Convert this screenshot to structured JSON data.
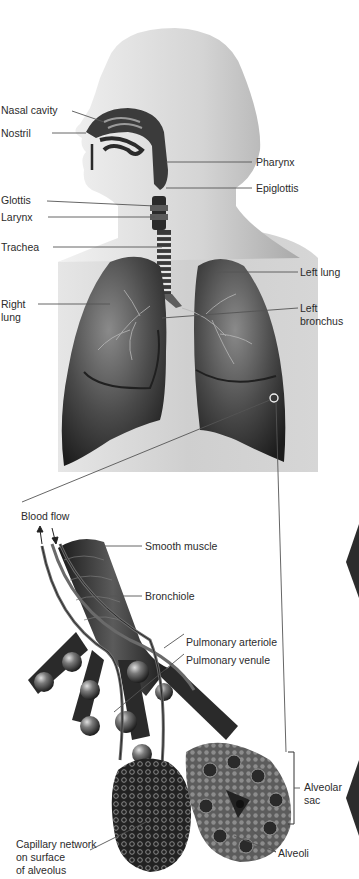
{
  "figure": {
    "upper_panel": {
      "labels": {
        "nasal_cavity": "Nasal cavity",
        "nostril": "Nostril",
        "pharynx": "Pharynx",
        "epiglottis": "Epiglottis",
        "glottis": "Glottis",
        "larynx": "Larynx",
        "trachea": "Trachea",
        "left_lung": "Left lung",
        "right_lung": "Right\nlung",
        "left_bronchus": "Left\nbronchus"
      }
    },
    "lower_panel": {
      "labels": {
        "blood_flow": "Blood flow",
        "smooth_muscle": "Smooth muscle",
        "bronchiole": "Bronchiole",
        "pulmonary_arteriole": "Pulmonary arteriole",
        "pulmonary_venule": "Pulmonary venule",
        "alveolar_sac": "Alveolar\nsac",
        "capillary_network": "Capillary network\non surface\nof alveolus",
        "alveoli": "Alveoli"
      }
    },
    "colors": {
      "background": "#ffffff",
      "panel_gray": "#c9c9c9",
      "skin": "#d8d8d8",
      "lung_dark": "#2e2e2e",
      "lung_mid": "#6a6a6a",
      "leader_line": "#555555",
      "text": "#2b2b2b"
    }
  }
}
